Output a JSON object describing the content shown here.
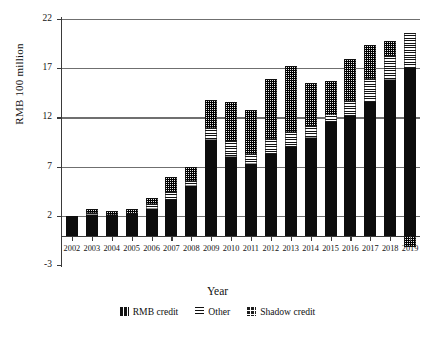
{
  "chart_data": {
    "type": "bar",
    "title": "",
    "subtitle": "",
    "xlabel": "Year",
    "ylabel": "RMB 100 million",
    "stacked": true,
    "grid": true,
    "legend_position": "bottom",
    "ylim": [
      -3,
      22
    ],
    "yticks": [
      -3,
      2,
      7,
      12,
      17,
      22
    ],
    "ytick_labels": [
      "-3",
      "2",
      "7",
      "12",
      "17",
      "22"
    ],
    "categories": [
      "2002",
      "2003",
      "2004",
      "2005",
      "2006",
      "2007",
      "2008",
      "2009",
      "2010",
      "2011",
      "2012",
      "2013",
      "2014",
      "2015",
      "2016",
      "2017",
      "2018",
      "2019"
    ],
    "series": [
      {
        "name": "RMB credit",
        "pattern": "solid-black",
        "values": [
          2.0,
          2.1,
          2.1,
          2.2,
          2.7,
          3.6,
          5.0,
          9.7,
          8.0,
          7.3,
          8.3,
          9.0,
          9.9,
          11.5,
          12.2,
          13.6,
          15.8,
          17.0
        ]
      },
      {
        "name": "Other",
        "pattern": "horizontal-stripes",
        "values": [
          0.0,
          0.2,
          0.0,
          0.0,
          0.5,
          0.8,
          0.5,
          1.2,
          1.6,
          1.0,
          1.5,
          1.5,
          1.2,
          0.8,
          1.5,
          2.3,
          2.4,
          3.6
        ]
      },
      {
        "name": "Shadow credit",
        "pattern": "checker",
        "values": [
          0.0,
          0.4,
          0.4,
          0.5,
          0.6,
          1.5,
          1.5,
          2.9,
          4.0,
          4.5,
          6.1,
          6.7,
          4.4,
          3.4,
          4.2,
          3.5,
          1.6,
          -1.2
        ]
      }
    ],
    "totals": [
      2.0,
      2.7,
      2.5,
      2.7,
      3.8,
      5.9,
      7.0,
      13.8,
      13.6,
      12.8,
      15.9,
      17.2,
      15.5,
      15.7,
      17.9,
      19.4,
      19.8,
      20.6
    ]
  },
  "legend": {
    "items": [
      {
        "label": "RMB credit"
      },
      {
        "label": "Other"
      },
      {
        "label": "Shadow credit"
      }
    ]
  },
  "axes": {
    "y_title": "RMB 100 million",
    "x_title": "Year"
  },
  "colors": {
    "ink": "#111111",
    "grid": "#6f6f6f",
    "axis": "#3a3a3a",
    "background": "#ffffff"
  }
}
